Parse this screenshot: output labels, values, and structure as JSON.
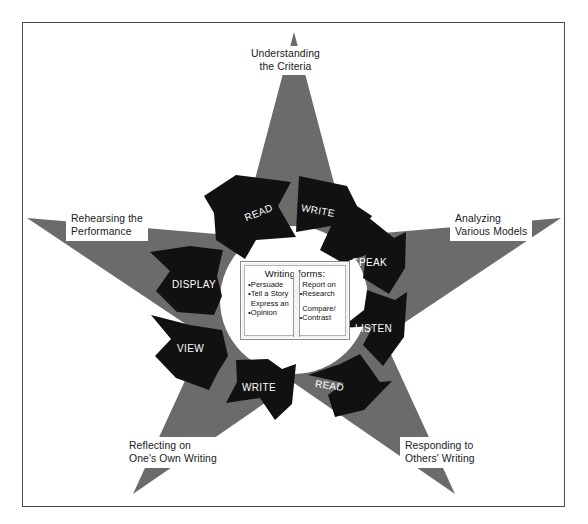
{
  "diagram": {
    "colors": {
      "star_fill": "#6b6b6b",
      "arrow_fill": "#111111",
      "frame_border": "#4a4a52",
      "background": "#ffffff",
      "label_text": "#1a1a1a",
      "arrow_text": "#ffffff"
    },
    "star_points": [
      {
        "id": "top",
        "label": "Understanding\nthe Criteria"
      },
      {
        "id": "left",
        "label": "Rehearsing the\nPerformance"
      },
      {
        "id": "right",
        "label": "Analyzing\nVarious Models"
      },
      {
        "id": "bottom-left",
        "label": "Reflecting on\nOne's Own Writing"
      },
      {
        "id": "bottom-right",
        "label": "Responding to\nOthers' Writing"
      }
    ],
    "cycle_arrows": [
      {
        "id": "read-top",
        "label": "READ",
        "x": 244,
        "y": 207,
        "rot": -22
      },
      {
        "id": "write-top",
        "label": "WRITE",
        "x": 301,
        "y": 205,
        "rot": 10
      },
      {
        "id": "speak",
        "label": "SPEAK",
        "x": 352,
        "y": 257,
        "rot": 0
      },
      {
        "id": "listen",
        "label": "LISTEN",
        "x": 355,
        "y": 323,
        "rot": 0
      },
      {
        "id": "read-bottom",
        "label": "READ",
        "x": 315,
        "y": 380,
        "rot": 8
      },
      {
        "id": "write-bottom",
        "label": "WRITE",
        "x": 242,
        "y": 382,
        "rot": 0
      },
      {
        "id": "view",
        "label": "VIEW",
        "x": 177,
        "y": 343,
        "rot": 0
      },
      {
        "id": "display",
        "label": "DISPLAY",
        "x": 172,
        "y": 279,
        "rot": 0
      }
    ],
    "center_panel": {
      "title": "Writing forms:",
      "left_column": [
        "Persuade",
        "Tell a Story",
        "Express an\n  Opinion"
      ],
      "right_column": [
        "Report on\n  Research",
        "Compare/\n  Contrast"
      ]
    }
  }
}
